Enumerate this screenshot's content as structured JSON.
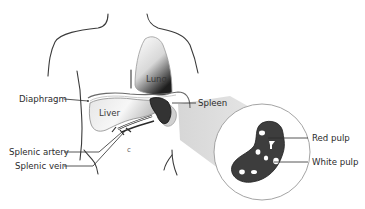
{
  "diagram": {
    "labels": {
      "lung": "Lung",
      "liver": "Liver",
      "diaphragm": "Diaphragm",
      "spleen": "Spleen",
      "splenic_artery": "Splenic artery",
      "splenic_vein": "Splenic vein",
      "red_pulp": "Red pulp",
      "white_pulp": "White pulp"
    },
    "colors": {
      "outline": "#3a3a3a",
      "spleen_fill": "#3d3d3d",
      "organ_light": "#f2f2f2",
      "organ_shade": "#bdbdbd",
      "magnify_cone": "#d9d9d9",
      "white_pulp_spots": "#ffffff"
    }
  }
}
